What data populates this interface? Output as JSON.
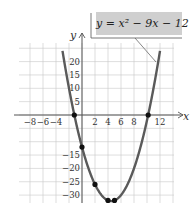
{
  "chart_data": {
    "type": "line",
    "title": "",
    "equation_label": "y = x² − 9x − 12",
    "xlabel": "x",
    "ylabel": "y",
    "xlim": [
      -10,
      14
    ],
    "ylim": [
      -36,
      27
    ],
    "grid": true,
    "x_tick_labels": [
      "−8",
      "−6",
      "−4",
      "2",
      "4",
      "6",
      "8",
      "12"
    ],
    "y_tick_labels": [
      "20",
      "15",
      "10",
      "5",
      "−15",
      "−20",
      "−25",
      "−30"
    ],
    "series": [
      {
        "name": "y = x^2 - 9x - 12",
        "function": "x^2 - 9x - 12",
        "x_range": [
          -3,
          12
        ]
      }
    ],
    "marked_points": [
      {
        "x": -1.18,
        "y": 0
      },
      {
        "x": 0,
        "y": -12
      },
      {
        "x": 2,
        "y": -26
      },
      {
        "x": 4,
        "y": -32
      },
      {
        "x": 5,
        "y": -32
      },
      {
        "x": 10.18,
        "y": 0
      }
    ],
    "colors": {
      "curve": "#5a5a5a",
      "grid": "#c8c8c8",
      "axis": "#555555",
      "label_bg": "#cfcfcf"
    }
  }
}
